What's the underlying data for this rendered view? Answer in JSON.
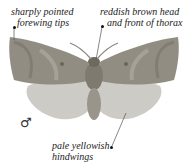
{
  "annotations": [
    {
      "id": "forewing-tips",
      "lines": [
        "sharply pointed",
        "forewing tips"
      ]
    },
    {
      "id": "head-thorax",
      "lines": [
        "reddish brown head",
        "and front of thorax"
      ]
    },
    {
      "id": "hindwings",
      "lines": [
        "pale yellowish",
        "hindwings"
      ]
    }
  ],
  "sex_symbol": "♂",
  "colors": {
    "forewing": "#8f8a7f",
    "forewing_dark": "#6f6a60",
    "hindwing": "#c9c7c2",
    "body": "#8a857b",
    "leader_line": "#555555"
  }
}
